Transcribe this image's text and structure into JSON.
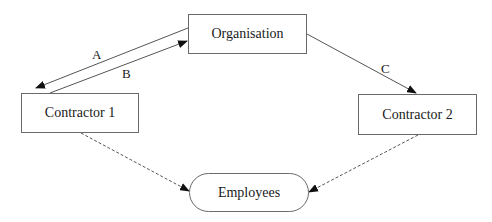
{
  "diagram": {
    "nodes": [
      {
        "id": "organisation",
        "label": "Organisation",
        "shape": "rect"
      },
      {
        "id": "contractor1",
        "label": "Contractor 1",
        "shape": "rect"
      },
      {
        "id": "contractor2",
        "label": "Contractor 2",
        "shape": "rect"
      },
      {
        "id": "employees",
        "label": "Employees",
        "shape": "rounded"
      }
    ],
    "edges": [
      {
        "from": "organisation",
        "to": "contractor1",
        "label": "A",
        "style": "solid"
      },
      {
        "from": "contractor1",
        "to": "organisation",
        "label": "B",
        "style": "solid"
      },
      {
        "from": "organisation",
        "to": "contractor2",
        "label": "C",
        "style": "solid"
      },
      {
        "from": "contractor1",
        "to": "employees",
        "label": "",
        "style": "dashed"
      },
      {
        "from": "contractor2",
        "to": "employees",
        "label": "",
        "style": "dashed"
      }
    ],
    "colors": {
      "stroke": "#6a6a6a",
      "arrow": "#111111",
      "text": "#1a1a1a"
    }
  }
}
